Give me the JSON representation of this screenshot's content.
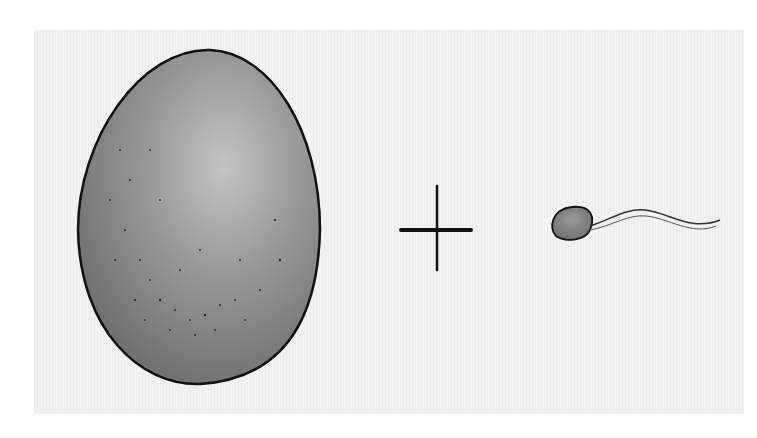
{
  "illustration": {
    "subject": "egg plus sperm",
    "elements": [
      {
        "name": "egg-cell",
        "shape": "oval",
        "fill": "#8a8a8a",
        "outline": "#111111"
      },
      {
        "name": "plus-sign",
        "symbol": "+"
      },
      {
        "name": "sperm-cell",
        "shape": "head-with-tail"
      }
    ],
    "colors": {
      "paper": "#f2f2f2",
      "ink": "#111111",
      "shade": "#8a8a8a"
    }
  }
}
